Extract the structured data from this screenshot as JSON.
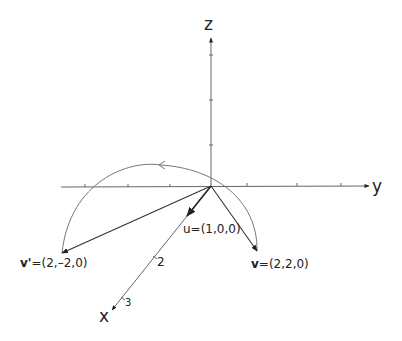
{
  "diagram": {
    "title": "",
    "axes": {
      "z_label": "z",
      "y_label": "y",
      "x_label": "x",
      "x_tick_labels": [
        "2",
        "3"
      ]
    },
    "vectors": {
      "u": {
        "label_prefix": "u",
        "label_rest": "=(1,0,0)"
      },
      "v": {
        "label_prefix": "v",
        "label_rest": "=(2,2,0)"
      },
      "v_prime": {
        "label_prefix": "v'",
        "label_rest": "=(2,–2,0)"
      }
    },
    "colors": {
      "axis": "#555555",
      "vector": "#333333",
      "arc": "#777777",
      "text": "#222222"
    }
  }
}
